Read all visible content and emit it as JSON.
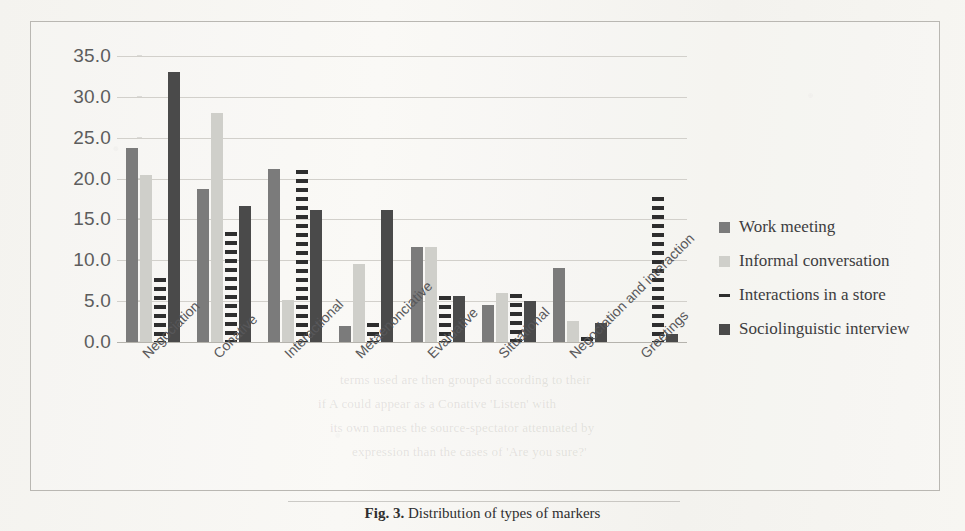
{
  "chart_data": {
    "type": "bar",
    "title": "",
    "xlabel": "",
    "ylabel": "",
    "ylim": [
      0.0,
      35.0
    ],
    "ytick_step": 5.0,
    "ytick_labels": [
      "35.0",
      "30.0",
      "25.0",
      "20.0",
      "15.0",
      "10.0",
      "5.0",
      "0.0"
    ],
    "grid": true,
    "legend_position": "right",
    "categories": [
      "Negociation",
      "Conative",
      "Interactional",
      "Metaenonciative",
      "Evaluative",
      "Situational",
      "Negociation and interaction",
      "Greetings"
    ],
    "series": [
      {
        "name": "Work meeting",
        "color": "#7b7b7b",
        "style": "solid",
        "values": [
          23.7,
          18.7,
          21.2,
          1.9,
          11.6,
          4.5,
          9.0,
          0.0
        ]
      },
      {
        "name": "Informal conversation",
        "color": "#cfcfca",
        "style": "solid",
        "values": [
          20.5,
          28.0,
          5.2,
          9.5,
          11.6,
          6.0,
          2.6,
          0.0
        ]
      },
      {
        "name": "Interactions in a store",
        "color": "#2e2e2e",
        "style": "dashed",
        "values": [
          7.8,
          13.5,
          21.1,
          2.3,
          5.6,
          5.9,
          0.6,
          17.8
        ]
      },
      {
        "name": "Sociolinguistic interview",
        "color": "#4a4a4a",
        "style": "solid",
        "values": [
          33.0,
          16.7,
          16.2,
          16.2,
          5.6,
          5.0,
          2.3,
          1.0
        ]
      }
    ]
  },
  "legend": {
    "items": [
      {
        "label": "Work meeting",
        "swatch": "swatch-dark-gray"
      },
      {
        "label": "Informal conversation",
        "swatch": "swatch-light-gray"
      },
      {
        "label": "Interactions in a store",
        "swatch": "swatch-dashed-line"
      },
      {
        "label": "Sociolinguistic interview",
        "swatch": "swatch-black"
      }
    ]
  },
  "caption": {
    "figure_number": "Fig. 3.",
    "text": "Distribution of types of markers"
  },
  "bleed_text": [
    "terms used are then grouped according to their",
    "if A could appear as a Conative 'Listen' with",
    "its own names the source-spectator attenuated by",
    "expression than the cases of 'Are you sure?'"
  ]
}
